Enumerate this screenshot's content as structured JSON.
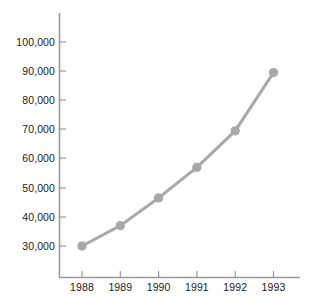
{
  "chart_data": {
    "type": "line",
    "title": "",
    "xlabel": "",
    "ylabel": "",
    "categories": [
      "1988",
      "1989",
      "1990",
      "1991",
      "1992",
      "1993"
    ],
    "values": [
      30000,
      37000,
      46500,
      57000,
      69500,
      89500
    ],
    "series": [
      {
        "name": "",
        "values": [
          30000,
          37000,
          46500,
          57000,
          69500,
          89500
        ]
      }
    ],
    "ylim": [
      20000,
      105000
    ],
    "y_ticks": [
      30000,
      40000,
      50000,
      60000,
      70000,
      80000,
      90000,
      100000
    ],
    "y_tick_labels": [
      "30,000",
      "40,000",
      "50,000",
      "60,000",
      "70,000",
      "80,000",
      "90,000",
      "100,000"
    ],
    "x_tick_labels": [
      "1988",
      "1989",
      "1990",
      "1991",
      "1992",
      "1993"
    ],
    "grid": false,
    "legend": false,
    "legend_position": "none",
    "marker": "circle",
    "colors": {
      "series": "#a8a8a8",
      "marker": "#a8a8a8",
      "axis": "#9a9a9a",
      "text": "#1a1a1a",
      "background": "#ffffff"
    }
  },
  "axes": {
    "y_labels": [
      {
        "text": "100,000",
        "value": 100000
      },
      {
        "text": "90,000",
        "value": 90000
      },
      {
        "text": "80,000",
        "value": 80000
      },
      {
        "text": "70,000",
        "value": 70000
      },
      {
        "text": "60,000",
        "value": 60000
      },
      {
        "text": "50,000",
        "value": 50000
      },
      {
        "text": "40,000",
        "value": 40000
      },
      {
        "text": "30,000",
        "value": 30000
      }
    ],
    "x_labels": [
      {
        "text": "1988"
      },
      {
        "text": "1989"
      },
      {
        "text": "1990"
      },
      {
        "text": "1991"
      },
      {
        "text": "1992"
      },
      {
        "text": "1993"
      }
    ]
  }
}
